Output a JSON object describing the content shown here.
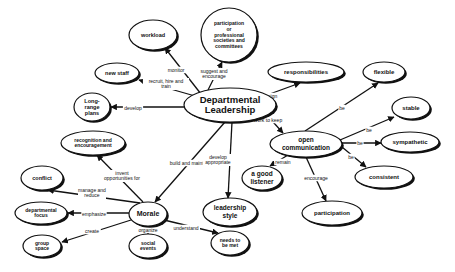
{
  "diagram": {
    "type": "concept-map",
    "center": {
      "id": "dept",
      "lines": [
        "Departmental",
        "Leadership"
      ]
    },
    "nodes": [
      {
        "id": "dept",
        "lines": [
          "Departmental",
          "Leadership"
        ],
        "cx": 230,
        "cy": 105,
        "rx": 46,
        "ry": 17,
        "size": 9.5
      },
      {
        "id": "workload",
        "lines": [
          "workload"
        ],
        "cx": 153,
        "cy": 35,
        "rx": 24,
        "ry": 15,
        "size": 5.5
      },
      {
        "id": "participation-prof",
        "lines": [
          "participation",
          "or",
          "professional",
          "societies and",
          "committees"
        ],
        "cx": 229,
        "cy": 35,
        "rx": 28,
        "ry": 27,
        "size": 5
      },
      {
        "id": "new-staff",
        "lines": [
          "new staff"
        ],
        "cx": 117,
        "cy": 73,
        "rx": 22,
        "ry": 10,
        "size": 5.5
      },
      {
        "id": "long-range",
        "lines": [
          "Long-",
          "range",
          "plans"
        ],
        "cx": 92,
        "cy": 107,
        "rx": 18,
        "ry": 14,
        "size": 5.5
      },
      {
        "id": "responsibilities",
        "lines": [
          "responsibilities"
        ],
        "cx": 306,
        "cy": 72,
        "rx": 38,
        "ry": 10,
        "size": 6
      },
      {
        "id": "flexible",
        "lines": [
          "flexible"
        ],
        "cx": 384,
        "cy": 72,
        "rx": 21,
        "ry": 10,
        "size": 6
      },
      {
        "id": "stable",
        "lines": [
          "stable"
        ],
        "cx": 411,
        "cy": 108,
        "rx": 19,
        "ry": 11,
        "size": 6
      },
      {
        "id": "open-comm",
        "lines": [
          "open",
          "communication"
        ],
        "cx": 306,
        "cy": 144,
        "rx": 36,
        "ry": 13,
        "size": 6.5
      },
      {
        "id": "sympathetic",
        "lines": [
          "sympathetic"
        ],
        "cx": 410,
        "cy": 142,
        "rx": 29,
        "ry": 10,
        "size": 6
      },
      {
        "id": "consistent",
        "lines": [
          "consistent"
        ],
        "cx": 384,
        "cy": 177,
        "rx": 29,
        "ry": 11,
        "size": 6
      },
      {
        "id": "good-listener",
        "lines": [
          "a good",
          "listener"
        ],
        "cx": 262,
        "cy": 178,
        "rx": 20,
        "ry": 12,
        "size": 6.5
      },
      {
        "id": "participation",
        "lines": [
          "participation"
        ],
        "cx": 332,
        "cy": 213,
        "rx": 30,
        "ry": 12,
        "size": 6
      },
      {
        "id": "recognition",
        "lines": [
          "recognition and",
          "encouragement"
        ],
        "cx": 93,
        "cy": 143,
        "rx": 32,
        "ry": 12,
        "size": 5
      },
      {
        "id": "conflict",
        "lines": [
          "conflict"
        ],
        "cx": 42,
        "cy": 178,
        "rx": 21,
        "ry": 12,
        "size": 5.5
      },
      {
        "id": "morale",
        "lines": [
          "Morale"
        ],
        "cx": 148,
        "cy": 214,
        "rx": 19,
        "ry": 12,
        "size": 7
      },
      {
        "id": "leadership-style",
        "lines": [
          "leadership",
          "style"
        ],
        "cx": 230,
        "cy": 212,
        "rx": 27,
        "ry": 14,
        "size": 6.5
      },
      {
        "id": "dept-focus",
        "lines": [
          "departmental",
          "focus"
        ],
        "cx": 41,
        "cy": 213,
        "rx": 26,
        "ry": 11,
        "size": 5
      },
      {
        "id": "group-space",
        "lines": [
          "group",
          "space"
        ],
        "cx": 42,
        "cy": 246,
        "rx": 19,
        "ry": 11,
        "size": 5
      },
      {
        "id": "social-events",
        "lines": [
          "social",
          "events"
        ],
        "cx": 148,
        "cy": 246,
        "rx": 19,
        "ry": 12,
        "size": 5
      },
      {
        "id": "needs-met",
        "lines": [
          "needs to",
          "be met"
        ],
        "cx": 230,
        "cy": 243,
        "rx": 19,
        "ry": 12,
        "size": 5
      }
    ],
    "edges": [
      {
        "from": "dept",
        "to": "workload",
        "label": "monitor",
        "x1": 201,
        "y1": 94,
        "x2": 165,
        "y2": 48,
        "lx": 176,
        "ly": 70
      },
      {
        "from": "dept",
        "to": "participation-prof",
        "label": "suggest and encourage",
        "label_lines": [
          "suggest and",
          "encourage"
        ],
        "x1": 208,
        "y1": 90,
        "x2": 222,
        "y2": 62,
        "lx": 214,
        "ly": 74
      },
      {
        "from": "dept",
        "to": "new-staff",
        "label": "recruit, hire and train",
        "label_lines": [
          "recruit, hire and",
          "train"
        ],
        "x1": 195,
        "y1": 96,
        "x2": 139,
        "y2": 80,
        "lx": 166,
        "ly": 84
      },
      {
        "from": "dept",
        "to": "long-range",
        "label": "develop",
        "x1": 184,
        "y1": 107,
        "x2": 111,
        "y2": 107,
        "lx": 133,
        "ly": 108
      },
      {
        "from": "dept",
        "to": "responsibilities",
        "label": "assign",
        "x1": 267,
        "y1": 95,
        "x2": 300,
        "y2": 83,
        "lx": 270,
        "ly": 96
      },
      {
        "from": "dept",
        "to": "open-comm",
        "label": "work to keep",
        "x1": 265,
        "y1": 113,
        "x2": 283,
        "y2": 133,
        "lx": 268,
        "ly": 120
      },
      {
        "from": "open-comm",
        "to": "flexible",
        "label": "be",
        "x1": 305,
        "y1": 131,
        "x2": 378,
        "y2": 83,
        "lx": 342,
        "ly": 108
      },
      {
        "from": "open-comm",
        "to": "stable",
        "label": "be",
        "x1": 340,
        "y1": 140,
        "x2": 394,
        "y2": 117,
        "lx": 369,
        "ly": 130
      },
      {
        "from": "open-comm",
        "to": "sympathetic",
        "label": "be",
        "x1": 342,
        "y1": 143,
        "x2": 381,
        "y2": 143,
        "lx": 360,
        "ly": 143
      },
      {
        "from": "open-comm",
        "to": "consistent",
        "label": "be",
        "x1": 342,
        "y1": 147,
        "x2": 366,
        "y2": 167,
        "lx": 351,
        "ly": 157
      },
      {
        "from": "open-comm",
        "to": "good-listener",
        "label": "remain",
        "x1": 288,
        "y1": 155,
        "x2": 270,
        "y2": 166,
        "lx": 283,
        "ly": 162
      },
      {
        "from": "open-comm",
        "to": "participation",
        "label": "encourage",
        "x1": 306,
        "y1": 157,
        "x2": 326,
        "y2": 201,
        "lx": 316,
        "ly": 178
      },
      {
        "from": "dept",
        "to": "morale",
        "label": "build and maintain",
        "x1": 225,
        "y1": 122,
        "x2": 155,
        "y2": 202,
        "lx": 190,
        "ly": 163
      },
      {
        "from": "dept",
        "to": "leadership-style",
        "label": "develop appropriate",
        "label_lines": [
          "develop",
          "appropriate"
        ],
        "x1": 232,
        "y1": 122,
        "x2": 228,
        "y2": 198,
        "lx": 218,
        "ly": 160
      },
      {
        "from": "morale",
        "to": "recognition",
        "label": "invent opportunities for",
        "label_lines": [
          "invent",
          "opportunities for"
        ],
        "x1": 143,
        "y1": 202,
        "x2": 97,
        "y2": 155,
        "lx": 122,
        "ly": 176
      },
      {
        "from": "morale",
        "to": "conflict",
        "label": "manage and reduce",
        "label_lines": [
          "manage and",
          "reduce"
        ],
        "x1": 140,
        "y1": 203,
        "x2": 48,
        "y2": 190,
        "lx": 92,
        "ly": 193
      },
      {
        "from": "morale",
        "to": "dept-focus",
        "label": "emphasize",
        "x1": 129,
        "y1": 213,
        "x2": 68,
        "y2": 213,
        "lx": 94,
        "ly": 214
      },
      {
        "from": "morale",
        "to": "group-space",
        "label": "create",
        "x1": 131,
        "y1": 220,
        "x2": 62,
        "y2": 242,
        "lx": 92,
        "ly": 231
      },
      {
        "from": "morale",
        "to": "social-events",
        "label": "organize",
        "x1": 148,
        "y1": 226,
        "x2": 148,
        "y2": 234,
        "lx": 148,
        "ly": 230
      },
      {
        "from": "morale",
        "to": "needs-met",
        "label": "understand",
        "x1": 164,
        "y1": 220,
        "x2": 218,
        "y2": 233,
        "lx": 186,
        "ly": 228
      }
    ]
  }
}
